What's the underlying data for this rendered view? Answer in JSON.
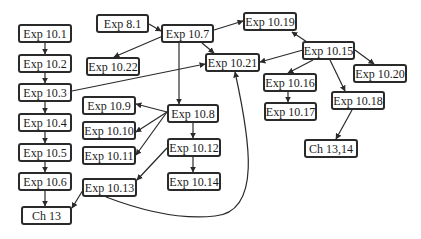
{
  "diagram": {
    "type": "dependency-graph",
    "nodes": [
      {
        "id": "e10_1",
        "label": "Exp 10.1",
        "x": 18,
        "y": 24,
        "w": 54,
        "h": 19
      },
      {
        "id": "e10_2",
        "label": "Exp 10.2",
        "x": 18,
        "y": 54,
        "w": 54,
        "h": 19
      },
      {
        "id": "e10_3",
        "label": "Exp 10.3",
        "x": 18,
        "y": 83,
        "w": 54,
        "h": 19
      },
      {
        "id": "e10_4",
        "label": "Exp 10.4",
        "x": 18,
        "y": 113,
        "w": 54,
        "h": 19
      },
      {
        "id": "e10_5",
        "label": "Exp 10.5",
        "x": 18,
        "y": 143,
        "w": 54,
        "h": 19
      },
      {
        "id": "e10_6",
        "label": "Exp 10.6",
        "x": 18,
        "y": 172,
        "w": 54,
        "h": 19
      },
      {
        "id": "ch13",
        "label": "Ch 13",
        "x": 21,
        "y": 206,
        "w": 51,
        "h": 19
      },
      {
        "id": "e8_1",
        "label": "Exp 8.1",
        "x": 96,
        "y": 14,
        "w": 53,
        "h": 19
      },
      {
        "id": "e10_7",
        "label": "Exp 10.7",
        "x": 161,
        "y": 24,
        "w": 53,
        "h": 19
      },
      {
        "id": "e10_22",
        "label": "Exp 10.22",
        "x": 86,
        "y": 57,
        "w": 54,
        "h": 19
      },
      {
        "id": "e10_21",
        "label": "Exp 10.21",
        "x": 205,
        "y": 53,
        "w": 55,
        "h": 19
      },
      {
        "id": "e10_19",
        "label": "Exp 10.19",
        "x": 243,
        "y": 12,
        "w": 54,
        "h": 19
      },
      {
        "id": "e10_15",
        "label": "Exp 10.15",
        "x": 302,
        "y": 41,
        "w": 53,
        "h": 19
      },
      {
        "id": "e10_16",
        "label": "Exp 10.16",
        "x": 263,
        "y": 73,
        "w": 54,
        "h": 19
      },
      {
        "id": "e10_17",
        "label": "Exp 10.17",
        "x": 264,
        "y": 102,
        "w": 53,
        "h": 19
      },
      {
        "id": "e10_20",
        "label": "Exp 10.20",
        "x": 353,
        "y": 64,
        "w": 54,
        "h": 19
      },
      {
        "id": "e10_18",
        "label": "Exp 10.18",
        "x": 331,
        "y": 91,
        "w": 54,
        "h": 19
      },
      {
        "id": "ch13_14",
        "label": "Ch 13,14",
        "x": 304,
        "y": 139,
        "w": 54,
        "h": 19
      },
      {
        "id": "e10_9",
        "label": "Exp 10.9",
        "x": 82,
        "y": 96,
        "w": 54,
        "h": 19
      },
      {
        "id": "e10_10",
        "label": "Exp 10.10",
        "x": 82,
        "y": 121,
        "w": 54,
        "h": 19
      },
      {
        "id": "e10_11",
        "label": "Exp 10.11",
        "x": 82,
        "y": 146,
        "w": 54,
        "h": 19
      },
      {
        "id": "e10_8",
        "label": "Exp 10.8",
        "x": 167,
        "y": 104,
        "w": 52,
        "h": 19
      },
      {
        "id": "e10_12",
        "label": "Exp 10.12",
        "x": 167,
        "y": 138,
        "w": 54,
        "h": 19
      },
      {
        "id": "e10_14",
        "label": "Exp 10.14",
        "x": 167,
        "y": 172,
        "w": 54,
        "h": 19
      },
      {
        "id": "e10_13",
        "label": "Exp 10.13",
        "x": 82,
        "y": 178,
        "w": 55,
        "h": 19
      }
    ],
    "edges": [
      {
        "from": "e10_1",
        "to": "e10_2",
        "path": "M45,43 L45,54"
      },
      {
        "from": "e10_2",
        "to": "e10_3",
        "path": "M45,73 L45,83"
      },
      {
        "from": "e10_3",
        "to": "e10_4",
        "path": "M45,102 L45,113"
      },
      {
        "from": "e10_4",
        "to": "e10_5",
        "path": "M45,132 L45,143"
      },
      {
        "from": "e10_5",
        "to": "e10_6",
        "path": "M45,162 L45,172"
      },
      {
        "from": "e10_6",
        "to": "ch13",
        "path": "M45,191 L45,206"
      },
      {
        "from": "e10_3",
        "to": "e10_21",
        "path": "M72,91 L205,64"
      },
      {
        "from": "e8_1",
        "to": "e10_7",
        "path": "M149,24 L161,31"
      },
      {
        "from": "e10_7",
        "to": "e10_22",
        "path": "M163,36 L114,57"
      },
      {
        "from": "e10_7",
        "to": "e10_21",
        "path": "M202,43 L214,53"
      },
      {
        "from": "e10_7",
        "to": "e10_19",
        "path": "M214,30 L243,21"
      },
      {
        "from": "e10_7",
        "to": "e10_8",
        "path": "M179,43 L179,104"
      },
      {
        "from": "e10_15",
        "to": "e10_19",
        "path": "M307,42 L292,32"
      },
      {
        "from": "e10_15",
        "to": "e10_21",
        "path": "M303,50 L260,62"
      },
      {
        "from": "e10_15",
        "to": "e10_16",
        "path": "M313,60 L288,73"
      },
      {
        "from": "e10_15",
        "to": "e10_18",
        "path": "M330,60 L345,91"
      },
      {
        "from": "e10_15",
        "to": "e10_20",
        "path": "M355,50 L374,64"
      },
      {
        "from": "e10_16",
        "to": "e10_17",
        "path": "M288,92 L288,102"
      },
      {
        "from": "e10_18",
        "to": "ch13_14",
        "path": "M352,110 L336,139"
      },
      {
        "from": "e10_8",
        "to": "e10_9",
        "path": "M167,112 L136,104"
      },
      {
        "from": "e10_8",
        "to": "e10_10",
        "path": "M167,112 L136,132"
      },
      {
        "from": "e10_8",
        "to": "e10_11",
        "path": "M167,112 L136,155"
      },
      {
        "from": "e10_8",
        "to": "e10_12",
        "path": "M193,123 L193,138"
      },
      {
        "from": "e10_12",
        "to": "e10_14",
        "path": "M193,157 L193,172"
      },
      {
        "from": "e10_12",
        "to": "e10_13",
        "path": "M167,148 L137,180"
      },
      {
        "from": "e10_13",
        "to": "ch13",
        "path": "M83,190 L72,208"
      },
      {
        "from": "e10_13",
        "to": "e10_21",
        "path": "M106,197 C140,210 180,220 215,216 C262,212 250,140 235,72"
      }
    ],
    "colors": {
      "stroke": "#2a2a2a",
      "background": "#ffffff",
      "text": "#1a1a1a"
    }
  }
}
